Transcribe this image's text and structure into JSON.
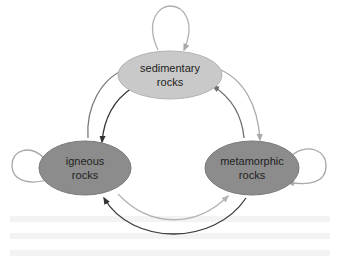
{
  "diagram": {
    "nodes": [
      {
        "id": "sedimentary",
        "label_line1": "sedimentary",
        "label_line2": "rocks",
        "fill": "#c9c9c9"
      },
      {
        "id": "igneous",
        "label_line1": "igneous",
        "label_line2": "rocks",
        "fill": "#8c8c8c"
      },
      {
        "id": "metamorphic",
        "label_line1": "metamorphic",
        "label_line2": "rocks",
        "fill": "#8c8c8c"
      }
    ],
    "edges": [
      {
        "from": "sedimentary",
        "to": "sedimentary",
        "color": "#b0b0b0"
      },
      {
        "from": "igneous",
        "to": "igneous",
        "color": "#a8a8a8"
      },
      {
        "from": "metamorphic",
        "to": "metamorphic",
        "color": "#a8a8a8"
      },
      {
        "from": "igneous",
        "to": "sedimentary",
        "color": "#7a7a7a"
      },
      {
        "from": "sedimentary",
        "to": "igneous",
        "color": "#333333"
      },
      {
        "from": "sedimentary",
        "to": "metamorphic",
        "color": "#a8a8a8"
      },
      {
        "from": "metamorphic",
        "to": "sedimentary",
        "color": "#6e6e6e"
      },
      {
        "from": "igneous",
        "to": "metamorphic",
        "color": "#b5b5b5"
      },
      {
        "from": "metamorphic",
        "to": "igneous",
        "color": "#3a3a3a"
      }
    ]
  }
}
